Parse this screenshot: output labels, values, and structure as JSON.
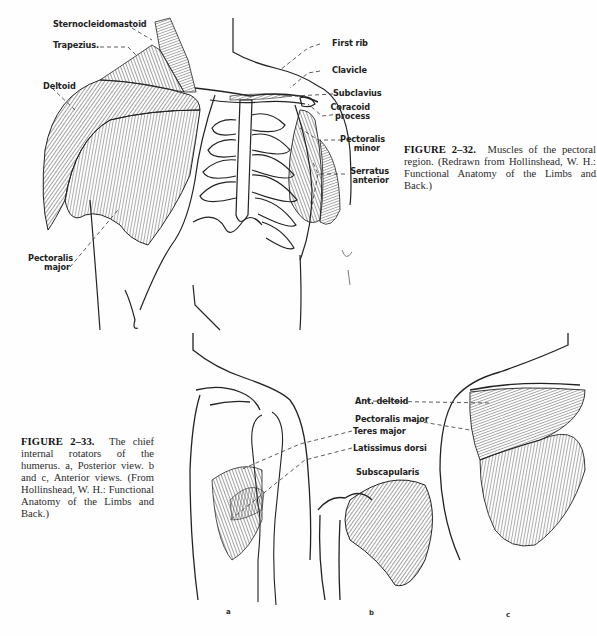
{
  "figure_2_32": {
    "caption": {
      "label": "FIGURE 2–32.",
      "text": "Muscles of the pectoral region. (Redrawn from Hollinshead, W. H.: Functional Anatomy of the Limbs and Back.)"
    },
    "labels": {
      "sternocleidomastoid": "Sternocleidomastoid",
      "trapezius": "Trapezius.",
      "deltoid": "Deltoid",
      "pectoralis_major_1": "Pectoralis",
      "pectoralis_major_2": "major",
      "first_rib": "First rib",
      "clavicle": "Clavicle",
      "subclavius": "Subclavius",
      "coracoid_1": "Coracoid",
      "coracoid_2": "process",
      "pectoralis_minor_1": "Pectoralis",
      "pectoralis_minor_2": "minor",
      "serratus_1": "Serratus",
      "serratus_2": "anterior"
    }
  },
  "figure_2_33": {
    "caption": {
      "label": "FIGURE 2–33.",
      "text": "The chief internal rotators of the humerus. a, Posterior view. b and c, Anterior views. (From Hollinshead, W. H.: Functional Anatomy of the Limbs and Back.)"
    },
    "labels": {
      "ant_deltoid": "Ant. deltoid",
      "pectoralis_major": "Pectoralis major",
      "teres_major": "Teres major",
      "latissimus_dorsi": "Latissimus dorsi",
      "subscapularis": "Subscapularis"
    },
    "panels": [
      "a",
      "b",
      "c"
    ]
  }
}
